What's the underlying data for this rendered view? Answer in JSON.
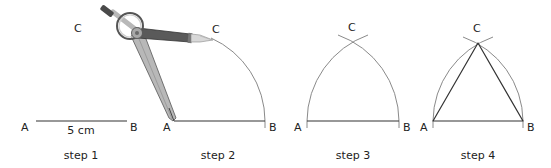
{
  "figure": {
    "colors": {
      "line": "#333333",
      "arc": "#8a8a8a",
      "compass_dark": "#5a5a5a",
      "compass_light": "#b8b8b8",
      "pencil_tip": "#d8d8d8"
    },
    "steps": [
      {
        "caption": "step 1",
        "labels": {
          "A": "A",
          "B": "B",
          "C": "C"
        },
        "measure": "5 cm"
      },
      {
        "caption": "step 2",
        "labels": {
          "A": "A",
          "B": "B",
          "C": "C"
        }
      },
      {
        "caption": "step 3",
        "labels": {
          "A": "A",
          "B": "B",
          "C": "C"
        }
      },
      {
        "caption": "step 4",
        "labels": {
          "A": "A",
          "B": "B",
          "C": "C"
        }
      }
    ]
  }
}
